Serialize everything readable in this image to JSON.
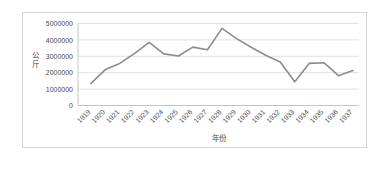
{
  "chart_data": {
    "type": "line",
    "title": "",
    "xlabel": "年份",
    "ylabel": "公斤",
    "ylabel_chars": [
      "公",
      "斤"
    ],
    "categories": [
      "1919",
      "1920",
      "1921",
      "1922",
      "1923",
      "1924",
      "1925",
      "1926",
      "1927",
      "1928",
      "1929",
      "1930",
      "1931",
      "1932",
      "1933",
      "1934",
      "1935",
      "1936",
      "1937"
    ],
    "values": [
      1350000,
      2200000,
      2580000,
      3180000,
      3850000,
      3150000,
      3020000,
      3560000,
      3400000,
      4700000,
      4080000,
      3550000,
      3060000,
      2650000,
      1450000,
      2570000,
      2610000,
      1820000,
      2130000
    ],
    "ylim": [
      0,
      5000000
    ],
    "ytick_labels": [
      "0",
      "1000000",
      "2000000",
      "3000000",
      "4000000",
      "5000000"
    ],
    "ytick_values": [
      0,
      1000000,
      2000000,
      3000000,
      4000000,
      5000000
    ],
    "grid": true,
    "legend": false,
    "series_color": "#8c8c8c",
    "grid_color": "#d9d9d9",
    "axis_color": "#bdbdbd",
    "xtick_rotation": -45
  }
}
